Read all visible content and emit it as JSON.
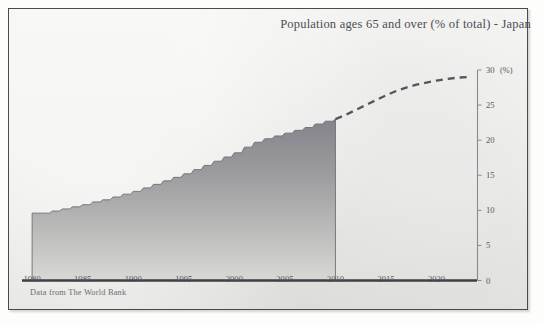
{
  "figure": {
    "title": "Population ages 65 and over (% of total) - Japan",
    "footnote": "Data from The World Bank",
    "unit_label": "(%)",
    "colors": {
      "paper": "#e9e9e6",
      "border": "#4a4a4a",
      "axis": "#3f3f44",
      "text": "#4d4d52",
      "fill_top": "#8b8b8e",
      "fill_bottom": "#d2d2d0",
      "dash": "#55555a"
    }
  },
  "chart_data": {
    "type": "area",
    "title": "Population ages 65 and over (% of total) - Japan",
    "xlabel": "",
    "ylabel": "(%)",
    "xlim": [
      1979,
      2024
    ],
    "ylim": [
      0,
      30
    ],
    "grid": false,
    "legend_position": "none",
    "y_ticks": [
      0,
      5,
      10,
      15,
      20,
      25,
      30
    ],
    "x_ticks": [
      1980,
      1985,
      1990,
      1995,
      2000,
      2005,
      2010,
      2015,
      2020
    ],
    "step_style": "post",
    "series": [
      {
        "name": "Observed",
        "style": "stepped-area-gradient",
        "x": [
          1980,
          1981,
          1982,
          1983,
          1984,
          1985,
          1986,
          1987,
          1988,
          1989,
          1990,
          1991,
          1992,
          1993,
          1994,
          1995,
          1996,
          1997,
          1998,
          1999,
          2000,
          2001,
          2002,
          2003,
          2004,
          2005,
          2006,
          2007,
          2008,
          2009,
          2010
        ],
        "values": [
          9.6,
          9.6,
          9.9,
          10.2,
          10.5,
          10.8,
          11.2,
          11.5,
          11.9,
          12.3,
          12.7,
          13.2,
          13.7,
          14.2,
          14.7,
          15.2,
          15.8,
          16.4,
          17.0,
          17.6,
          18.2,
          19.0,
          19.7,
          20.2,
          20.6,
          21.0,
          21.4,
          21.8,
          22.3,
          22.7,
          23.0
        ]
      },
      {
        "name": "Projection",
        "style": "dashed-line",
        "x": [
          2010,
          2011,
          2012,
          2013,
          2014,
          2015,
          2016,
          2017,
          2018,
          2019,
          2020,
          2021,
          2022,
          2023
        ],
        "values": [
          23.0,
          23.6,
          24.3,
          25.0,
          25.7,
          26.4,
          27.0,
          27.5,
          27.9,
          28.2,
          28.5,
          28.7,
          28.9,
          29.0
        ]
      }
    ]
  }
}
